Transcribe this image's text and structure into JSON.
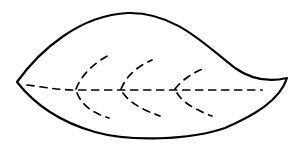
{
  "figure": {
    "subject": "leaf line drawing",
    "stroke_color": "#000000",
    "background_color": "#ffffff",
    "parts": {
      "outline": "leaf-outline",
      "midrib": "midrib-dashed",
      "veins": [
        "vein-upper-1",
        "vein-lower-1",
        "vein-upper-2",
        "vein-lower-2",
        "vein-upper-3",
        "vein-lower-3"
      ]
    }
  }
}
